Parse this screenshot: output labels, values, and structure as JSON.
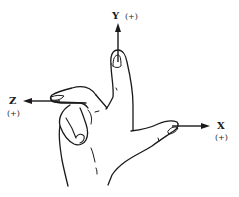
{
  "diagram": {
    "type": "right-hand-rule-coordinate-axes",
    "colors": {
      "ink": "#1a1a1a",
      "background": "#ffffff"
    },
    "axes": [
      {
        "id": "y",
        "label": "Y",
        "sign": "(+)",
        "direction": "up",
        "finger": "index"
      },
      {
        "id": "z",
        "label": "Z",
        "sign": "(+)",
        "direction": "left",
        "finger": "middle"
      },
      {
        "id": "x",
        "label": "X",
        "sign": "(+)",
        "direction": "right",
        "finger": "thumb"
      }
    ]
  }
}
